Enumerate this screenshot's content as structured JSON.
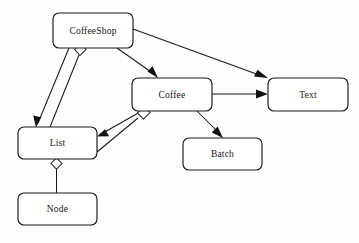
{
  "diagram": {
    "kind": "uml-class-relationship-diagram",
    "canvas": {
      "width": 359,
      "height": 243,
      "background": "#fdfdfb"
    },
    "style": {
      "box_fill": "#ffffff",
      "box_stroke": "#1a1a1a",
      "edge_stroke": "#1a1a1a",
      "text_color": "#161616",
      "diamond_fill": "#ffffff"
    },
    "nodes": [
      {
        "id": "coffeeshop",
        "label": "CoffeeShop",
        "x": 53,
        "y": 13,
        "w": 80,
        "h": 35,
        "rx": 6
      },
      {
        "id": "coffee",
        "label": "Coffee",
        "x": 132,
        "y": 78,
        "w": 80,
        "h": 33,
        "rx": 6
      },
      {
        "id": "text",
        "label": "Text",
        "x": 268,
        "y": 78,
        "w": 80,
        "h": 33,
        "rx": 6
      },
      {
        "id": "list",
        "label": "List",
        "x": 18,
        "y": 127,
        "w": 79,
        "h": 32,
        "rx": 6
      },
      {
        "id": "batch",
        "label": "Batch",
        "x": 183,
        "y": 138,
        "w": 79,
        "h": 32,
        "rx": 6
      },
      {
        "id": "node",
        "label": "Node",
        "x": 18,
        "y": 193,
        "w": 79,
        "h": 32,
        "rx": 6
      }
    ],
    "edges": [
      {
        "id": "coffeeshop-to-text",
        "from": "coffeeshop",
        "to": "text",
        "marker": "arrow",
        "label": ""
      },
      {
        "id": "coffeeshop-to-coffee",
        "from": "coffeeshop",
        "to": "coffee",
        "marker": "arrow",
        "label": ""
      },
      {
        "id": "coffeeshop-to-list",
        "from": "coffeeshop",
        "to": "list",
        "marker": "arrow",
        "label": ""
      },
      {
        "id": "coffeeshop-aggregates-list",
        "from": "coffeeshop",
        "to": "list",
        "marker": "aggregation-diamond",
        "label": ""
      },
      {
        "id": "coffee-to-text",
        "from": "coffee",
        "to": "text",
        "marker": "arrow",
        "label": ""
      },
      {
        "id": "coffee-to-batch",
        "from": "coffee",
        "to": "batch",
        "marker": "arrow",
        "label": ""
      },
      {
        "id": "coffee-to-list",
        "from": "coffee",
        "to": "list",
        "marker": "arrow",
        "label": ""
      },
      {
        "id": "coffee-aggregates-list",
        "from": "coffee",
        "to": "list",
        "marker": "aggregation-diamond",
        "label": ""
      },
      {
        "id": "list-aggregates-node",
        "from": "list",
        "to": "node",
        "marker": "aggregation-diamond",
        "label": ""
      }
    ]
  }
}
